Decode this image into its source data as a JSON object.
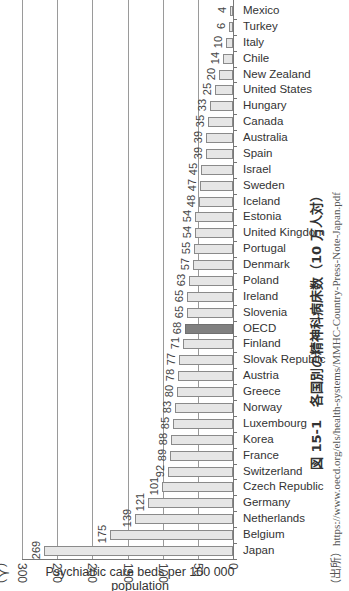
{
  "chart_data": {
    "type": "bar",
    "orientation": "horizontal",
    "xlabel": "Psychiatric care beds per 100 000 population",
    "unit_label": "(人)",
    "xlim": [
      0,
      300
    ],
    "xticks": [
      300,
      250,
      200,
      150,
      100,
      50,
      0
    ],
    "grid": true,
    "highlight": "OECD",
    "categories": [
      "Mexico",
      "Turkey",
      "Italy",
      "Chile",
      "New Zealand",
      "United States",
      "Hungary",
      "Canada",
      "Australia",
      "Spain",
      "Israel",
      "Sweden",
      "Iceland",
      "Estonia",
      "United Kingdom",
      "Portugal",
      "Denmark",
      "Poland",
      "Ireland",
      "Slovenia",
      "OECD",
      "Finland",
      "Slovak Republic",
      "Austria",
      "Greece",
      "Norway",
      "Luxembourg",
      "Korea",
      "France",
      "Switzerland",
      "Czech Republic",
      "Germany",
      "Netherlands",
      "Belgium",
      "Japan"
    ],
    "values": [
      4,
      6,
      10,
      14,
      20,
      25,
      33,
      35,
      39,
      39,
      45,
      47,
      48,
      54,
      54,
      55,
      57,
      63,
      65,
      65,
      68,
      71,
      77,
      78,
      80,
      83,
      85,
      88,
      89,
      92,
      101,
      121,
      139,
      175,
      269
    ],
    "source": "（出所）https://www.oecd.org/els/health-systems/MMHC-Country-Press-Note-Japan.pdf"
  },
  "labels": {
    "caption": "図 15-1　各国別の精神科病床数（10 万人対）",
    "source": "（出所）https://www.oecd.org/els/health-systems/MMHC-Country-Press-Note-Japan.pdf",
    "xlabel_line1": "Psychiatric care beds per 100 000",
    "xlabel_line2": "population",
    "unit": "(人)"
  },
  "colors": {
    "bar": "#e6e6e6",
    "highlight": "#808080",
    "grid": "#9a9a9a"
  }
}
